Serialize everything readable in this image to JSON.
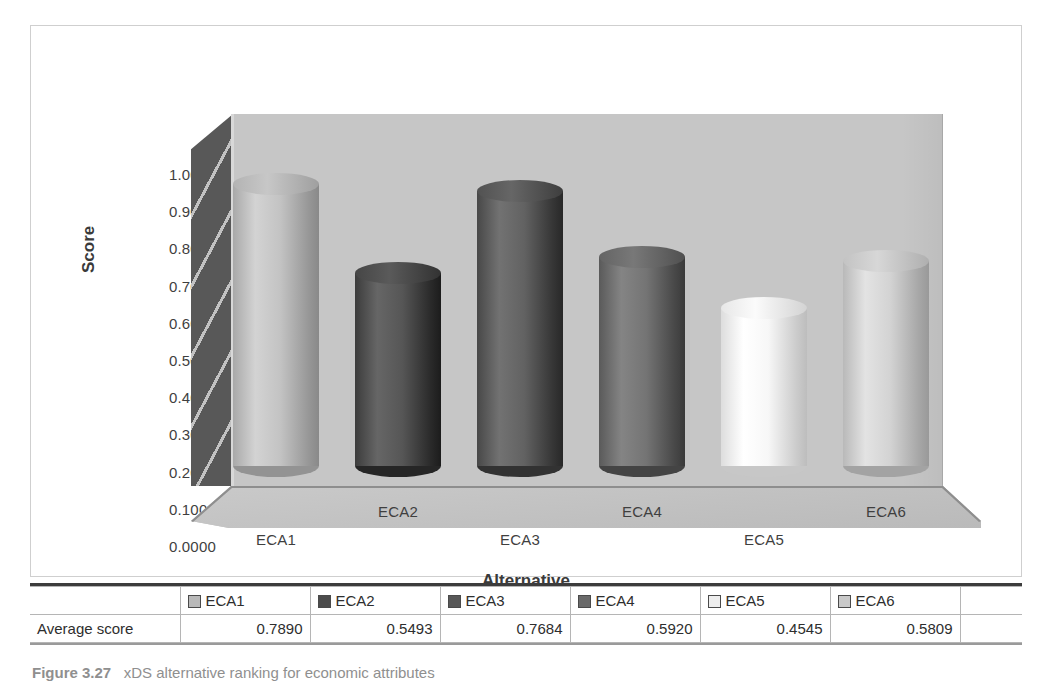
{
  "chart_data": {
    "type": "bar",
    "render_style": "3d-cylinder",
    "title": "",
    "categories": [
      "ECA1",
      "ECA2",
      "ECA3",
      "ECA4",
      "ECA5",
      "ECA6"
    ],
    "values": [
      0.789,
      0.5493,
      0.7684,
      0.592,
      0.4545,
      0.5809
    ],
    "series": [
      {
        "name": "Average score",
        "values": [
          0.789,
          0.5493,
          0.7684,
          0.592,
          0.4545,
          0.5809
        ]
      }
    ],
    "xlabel": "Alternative",
    "ylabel": "Score",
    "ylim": [
      0.0,
      1.0
    ],
    "ytick_step": 0.1,
    "ytick_labels": [
      "1.0000",
      "0.9000",
      "0.8000",
      "0.7000",
      "0.6000",
      "0.5000",
      "0.4000",
      "0.3000",
      "0.2000",
      "0.1000",
      "0.0000"
    ],
    "ytick_values": [
      1.0,
      0.9,
      0.8,
      0.7,
      0.6,
      0.5,
      0.4,
      0.3,
      0.2,
      0.1,
      0.0
    ],
    "grid": false,
    "legend_position": "bottom-table",
    "bar_colors": [
      "#b9b9b9",
      "#4c4c4c",
      "#585858",
      "#6a6a6a",
      "#ededed",
      "#c9c9c9"
    ],
    "value_format": "0.0000"
  },
  "axes": {
    "y_title": "Score",
    "x_title": "Alternative",
    "x_tick_labels": [
      "ECA1",
      "ECA2",
      "ECA3",
      "ECA4",
      "ECA5",
      "ECA6"
    ]
  },
  "table": {
    "row_label": "Average score",
    "headers": [
      "ECA1",
      "ECA2",
      "ECA3",
      "ECA4",
      "ECA5",
      "ECA6"
    ],
    "values": [
      "0.7890",
      "0.5493",
      "0.7684",
      "0.5920",
      "0.4545",
      "0.5809"
    ],
    "swatch_colors": [
      "#b9b9b9",
      "#4c4c4c",
      "#585858",
      "#6a6a6a",
      "#ededed",
      "#c9c9c9"
    ]
  },
  "caption": {
    "label": "Figure 3.27",
    "text": "xDS alternative ranking for economic attributes"
  },
  "colors": {
    "back_wall": "#c6c6c6",
    "left_wall": "#585858",
    "floor": "#c0c0c0",
    "frame_border": "#cfcfcf",
    "text": "#3a3a3a"
  }
}
